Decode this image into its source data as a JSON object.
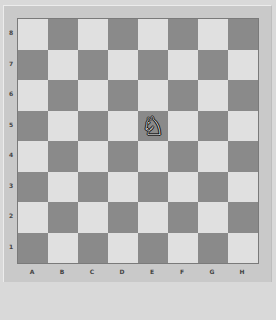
{
  "board": {
    "ranks": [
      "8",
      "7",
      "6",
      "5",
      "4",
      "3",
      "2",
      "1"
    ],
    "files": [
      "A",
      "B",
      "C",
      "D",
      "E",
      "F",
      "G",
      "H"
    ],
    "colors": {
      "light": "#e0e0e0",
      "dark": "#8a8a8a"
    },
    "pieces": [
      {
        "square": "E5",
        "type": "knight",
        "color": "white",
        "glyph": "♘"
      }
    ]
  }
}
